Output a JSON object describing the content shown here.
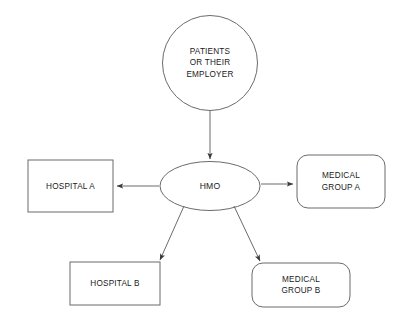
{
  "diagram": {
    "background_color": "#ffffff",
    "stroke_color": "#6b6b6b",
    "text_color": "#1a1a1a",
    "nodes": {
      "source": {
        "shape": "circle",
        "lines": [
          "PATIENTS",
          "OR THEIR",
          "EMPLOYER"
        ]
      },
      "hub": {
        "shape": "ellipse",
        "lines": [
          "HMO"
        ]
      },
      "hospital_a": {
        "shape": "rectangle",
        "lines": [
          "HOSPITAL A"
        ]
      },
      "group_a": {
        "shape": "rounded-rectangle",
        "lines": [
          "MEDICAL",
          "GROUP A"
        ]
      },
      "hospital_b": {
        "shape": "rectangle",
        "lines": [
          "HOSPITAL B"
        ]
      },
      "group_b": {
        "shape": "rounded-rectangle",
        "lines": [
          "MEDICAL",
          "GROUP B"
        ]
      }
    },
    "connections": [
      {
        "from": "source",
        "to": "hub",
        "direction": "down"
      },
      {
        "from": "hub",
        "to": "hospital_a",
        "direction": "left"
      },
      {
        "from": "hub",
        "to": "group_a",
        "direction": "right"
      },
      {
        "from": "hub",
        "to": "hospital_b",
        "direction": "down-left"
      },
      {
        "from": "hub",
        "to": "group_b",
        "direction": "down-right"
      }
    ]
  }
}
